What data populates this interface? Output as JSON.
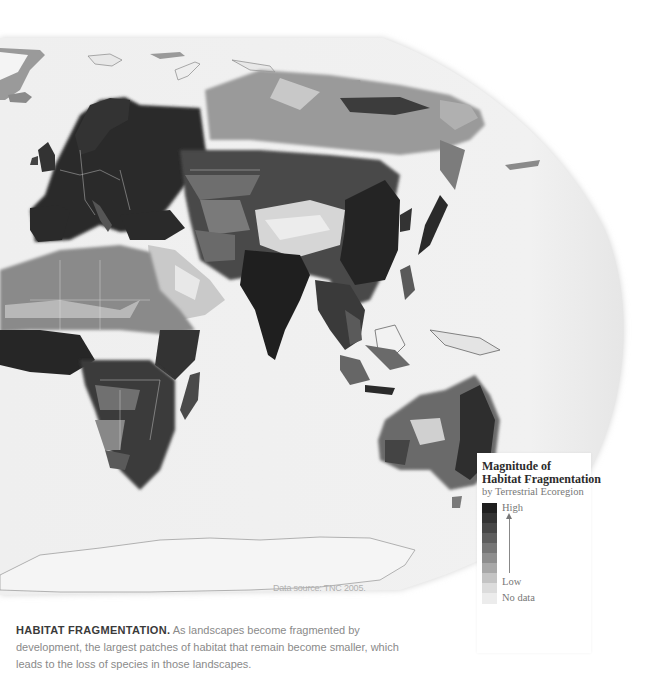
{
  "map": {
    "subject": "World map (Europe, Africa, Asia, Oceania, Antarctica) shaded by magnitude of habitat fragmentation per terrestrial ecoregion",
    "data_source": "Data source: TNC 2005."
  },
  "legend": {
    "title_line1": "Magnitude of",
    "title_line2": "Habitat Fragmentation",
    "subtitle": "by Terrestrial Ecoregion",
    "high_label": "High",
    "low_label": "Low",
    "nodata_label": "No data",
    "ramp_colors": [
      "#1f1f1f",
      "#333333",
      "#474747",
      "#5e5e5e",
      "#767676",
      "#8e8e8e",
      "#a8a8a8",
      "#c4c4c4",
      "#dcdcdc",
      "#ededed"
    ],
    "nodata_color": "#ececec"
  },
  "caption": {
    "lead": "HABITAT FRAGMENTATION.",
    "body": " As landscapes become fragmented by development, the largest patches of habitat that remain become smaller, which leads to the loss of species in those landscapes."
  },
  "colors": {
    "ocean": "#efefef",
    "high": "#262626",
    "mid_high": "#4a4a4a",
    "mid": "#7a7a7a",
    "mid_low": "#9c9c9c",
    "low": "#d8d8d8",
    "ice": "#f6f6f6",
    "borders": "#e8e8e8"
  }
}
